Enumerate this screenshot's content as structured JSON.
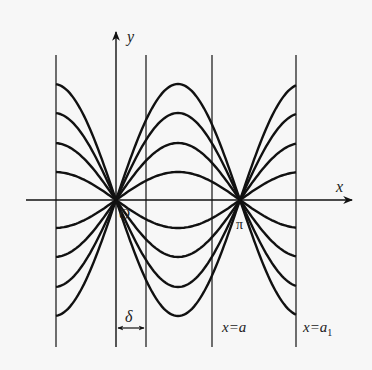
{
  "figure": {
    "axes": {
      "x_label": "x",
      "y_label": "y",
      "origin_label": "O",
      "pi_label": "π"
    },
    "vertical_lines": [
      {
        "id": "left-boundary",
        "label": ""
      },
      {
        "id": "y-axis",
        "label": ""
      },
      {
        "id": "delta-line",
        "label": ""
      },
      {
        "id": "x-eq-a",
        "label": "x=a"
      },
      {
        "id": "x-eq-a1",
        "label": "x=a",
        "subscript": "1"
      }
    ],
    "delta_label": "δ",
    "curves": {
      "family": "y = C·sin x",
      "amplitudes": [
        28,
        57,
        87,
        116,
        -28,
        -57,
        -87,
        -116
      ],
      "color": "#111111"
    }
  }
}
